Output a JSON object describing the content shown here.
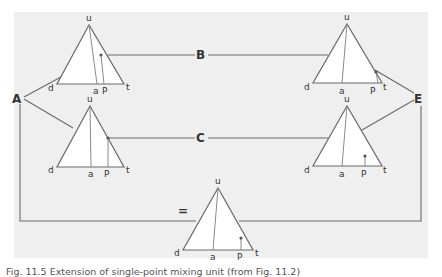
{
  "nodes": {
    "A": "A",
    "B": "B",
    "C": "C",
    "E": "E",
    "equals": "="
  },
  "vertex_labels": {
    "apex": "u",
    "left": "d",
    "right": "t",
    "median_foot": "a",
    "point": "P"
  },
  "triangles": [
    {
      "id": "top-left",
      "apex": [
        89,
        25
      ],
      "left": [
        57,
        84
      ],
      "right": [
        124,
        84
      ],
      "a": [
        97,
        84
      ],
      "p_dot": [
        101,
        55
      ],
      "p_foot": [
        104,
        84
      ]
    },
    {
      "id": "top-right",
      "apex": [
        347,
        24
      ],
      "left": [
        313,
        83
      ],
      "right": [
        382,
        83
      ],
      "a": [
        342,
        83
      ],
      "p_dot": [
        376,
        72
      ],
      "p_foot": [
        378,
        83
      ]
    },
    {
      "id": "middle-left",
      "apex": [
        90,
        106
      ],
      "left": [
        57,
        167
      ],
      "right": [
        124,
        167
      ],
      "a": [
        91,
        167
      ],
      "p_dot": [
        108,
        138
      ],
      "p_foot": [
        108,
        167
      ]
    },
    {
      "id": "middle-right",
      "apex": [
        347,
        106
      ],
      "left": [
        313,
        166
      ],
      "right": [
        382,
        166
      ],
      "a": [
        342,
        166
      ],
      "p_dot": [
        365,
        156
      ],
      "p_foot": [
        365,
        166
      ]
    },
    {
      "id": "bottom",
      "apex": [
        218,
        188
      ],
      "left": [
        183,
        250
      ],
      "right": [
        253,
        250
      ],
      "a": [
        213,
        250
      ],
      "p_dot": [
        241,
        238
      ],
      "p_foot": [
        241,
        250
      ]
    }
  ],
  "caption": "Fig. 11.5 Extension of single-point mixing unit (from Fig. 11.2)"
}
